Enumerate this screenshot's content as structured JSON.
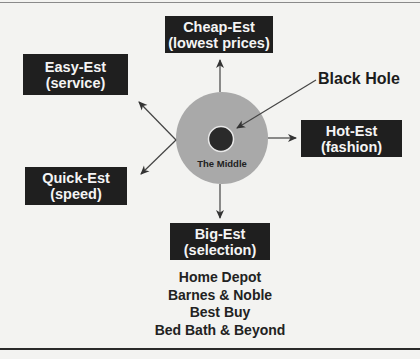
{
  "diagram": {
    "center": {
      "label": "The Middle",
      "fill": "#a9a9a9"
    },
    "core": {
      "label": "Black Hole",
      "fill": "#2a2a2a"
    },
    "boxes": {
      "cheap": {
        "title": "Cheap-Est",
        "subtitle": "(lowest prices)"
      },
      "easy": {
        "title": "Easy-Est",
        "subtitle": "(service)"
      },
      "quick": {
        "title": "Quick-Est",
        "subtitle": "(speed)"
      },
      "hot": {
        "title": "Hot-Est",
        "subtitle": "(fashion)"
      },
      "big": {
        "title": "Big-Est",
        "subtitle": "(selection)"
      }
    },
    "examples": [
      "Home Depot",
      "Barnes & Noble",
      "Best Buy",
      "Bed Bath & Beyond"
    ],
    "colors": {
      "box_bg": "#1f1f1f",
      "box_text": "#f4f4f4",
      "background": "#f3f3f1",
      "arrows": "#333333"
    }
  }
}
